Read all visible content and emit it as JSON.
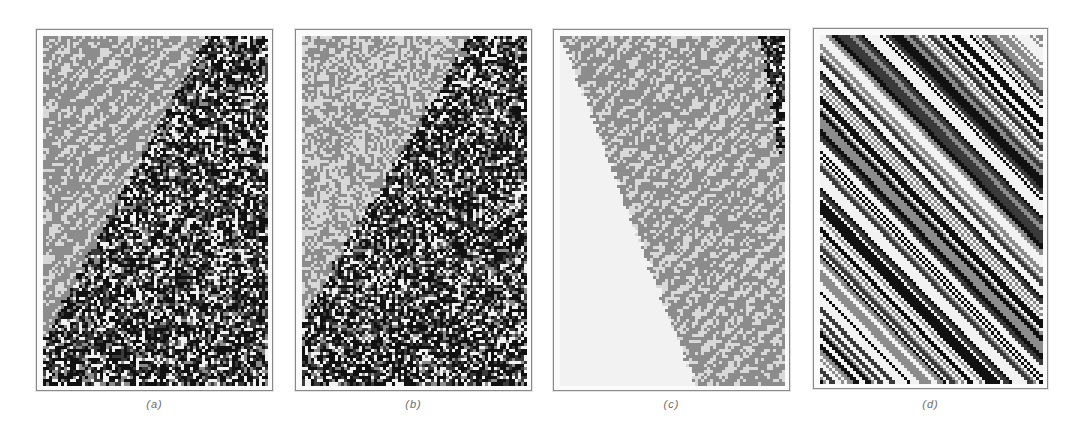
{
  "figure": {
    "panels": [
      {
        "id": "a",
        "caption": "(a)",
        "description": "Cellular automaton: grey patterned region (upper left) invaded by random black/white/grey region along a diagonal boundary",
        "frame": {
          "x": 36,
          "y": 29,
          "w": 237,
          "h": 362
        },
        "grid": {
          "cols": 75,
          "rows": 115
        },
        "boundary": {
          "type": "line",
          "top_frac": 0.72,
          "bottom_frac": -0.05,
          "bottom_row_frac": 0.92
        },
        "left_region": "grey-pattern",
        "right_region": "random-dark",
        "seed": 11
      },
      {
        "id": "b",
        "caption": "(b)",
        "description": "Cellular automaton: grey maze-like region (upper left) and random dark region along diagonal boundary",
        "frame": {
          "x": 295,
          "y": 29,
          "w": 237,
          "h": 362
        },
        "grid": {
          "cols": 75,
          "rows": 115
        },
        "boundary": {
          "type": "line",
          "top_frac": 0.74,
          "bottom_frac": -0.05,
          "bottom_row_frac": 0.85
        },
        "left_region": "grey-maze",
        "right_region": "random-dark",
        "seed": 23
      },
      {
        "id": "c",
        "caption": "(c)",
        "description": "Cellular automaton: blank region on left, grey patterned band in middle, random dark region at upper right",
        "frame": {
          "x": 553,
          "y": 29,
          "w": 237,
          "h": 362
        },
        "grid": {
          "cols": 75,
          "rows": 115
        },
        "boundary": {
          "type": "line",
          "top_frac": 0.0,
          "bottom_frac": 0.6,
          "bottom_row_frac": 1.0
        },
        "boundary2": {
          "type": "line",
          "top_frac": 0.88,
          "bottom_frac": 1.05,
          "bottom_row_frac": 0.6
        },
        "left_region": "blank",
        "mid_region": "grey-pattern",
        "right_region": "random-dark",
        "seed": 37
      },
      {
        "id": "d",
        "caption": "(d)",
        "description": "Cellular automaton: diagonal stripes of grey, black, white and checkerboard textures",
        "frame": {
          "x": 813,
          "y": 28,
          "w": 235,
          "h": 361
        },
        "grid": {
          "cols": 74,
          "rows": 114
        },
        "left_region": "diagonal-stripes",
        "seed": 51
      }
    ],
    "palette": {
      "white": "#f2f2f2",
      "light": "#d8d8d8",
      "grey": "#8c8c8c",
      "dark": "#3a3a3a",
      "black": "#111111"
    },
    "captions_y": 398
  }
}
